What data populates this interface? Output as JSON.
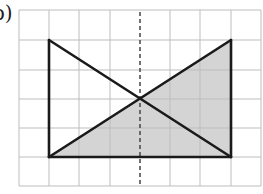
{
  "figure": {
    "label": "b)",
    "label_visible_fragment": ")",
    "grid": {
      "columns": 8,
      "rows": 6,
      "origin_px": [
        19,
        10
      ],
      "cell_width_px": 30.25,
      "cell_height_px": 29.33,
      "line_color": "#bdbdbd"
    },
    "rectangle": {
      "corners_grid": [
        [
          1,
          1
        ],
        [
          7,
          1
        ],
        [
          7,
          5
        ],
        [
          1,
          5
        ]
      ],
      "drawn_edges": [
        "left",
        "right",
        "bottom"
      ],
      "stroke_color": "#1a1a1a"
    },
    "diagonals": [
      {
        "from_grid": [
          1,
          1
        ],
        "to_grid": [
          7,
          5
        ]
      },
      {
        "from_grid": [
          1,
          5
        ],
        "to_grid": [
          7,
          1
        ]
      }
    ],
    "intersection_grid": [
      4,
      3
    ],
    "shaded_triangle": {
      "vertices_grid": [
        [
          1,
          5
        ],
        [
          7,
          1
        ],
        [
          7,
          5
        ]
      ],
      "fill_color": "#d4d4d4"
    },
    "symmetry_axis": {
      "type": "dashed",
      "x_grid": 4,
      "color": "#444444"
    }
  }
}
